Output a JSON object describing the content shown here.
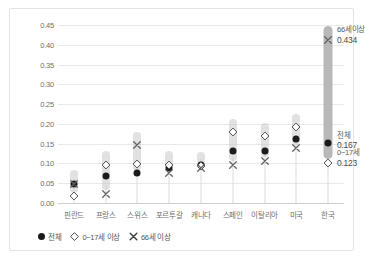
{
  "chart_data": {
    "type": "scatter",
    "title": "",
    "xlabel": "",
    "ylabel": "",
    "ylim": [
      0,
      0.45
    ],
    "grid": true,
    "legend_position": "bottom-left",
    "ytick_labels": [
      "0.45",
      "0.40",
      "0.35",
      "0.30",
      "0.25",
      "0.20",
      "0.15",
      "0.10",
      "0.05",
      "0.00"
    ],
    "ytick_values": [
      0.45,
      0.4,
      0.35,
      0.3,
      0.25,
      0.2,
      0.15,
      0.1,
      0.05,
      0.0
    ],
    "categories": [
      "핀란드",
      "프랑스",
      "스위스",
      "포르투갈",
      "캐나다",
      "스페인",
      "이탈리아",
      "미국",
      "한국"
    ],
    "series": [
      {
        "name": "전체",
        "marker": "filled-circle",
        "values": [
          0.065,
          0.085,
          0.093,
          0.105,
          0.113,
          0.148,
          0.148,
          0.178,
          0.167
        ]
      },
      {
        "name": "0~17세 이상",
        "marker": "diamond",
        "values": [
          0.038,
          0.118,
          0.12,
          0.118,
          0.116,
          0.2,
          0.19,
          0.213,
          0.123
        ]
      },
      {
        "name": "66세 이상",
        "marker": "cross",
        "values": [
          0.07,
          0.045,
          0.168,
          0.098,
          0.11,
          0.118,
          0.128,
          0.16,
          0.434
        ]
      }
    ],
    "annotations": [
      {
        "label": "66세이상",
        "value": "0.434",
        "category": "한국",
        "at": 0.434
      },
      {
        "label": "전체",
        "value": "0.167",
        "category": "한국",
        "at": 0.167
      },
      {
        "label": "0~17세",
        "value": "0.123",
        "category": "한국",
        "at": 0.123
      }
    ]
  },
  "legend": {
    "items": [
      {
        "label": "전체",
        "symbol": "filled-circle-icon"
      },
      {
        "label": "0~17세 이상",
        "symbol": "diamond-icon"
      },
      {
        "label": "66세 이상",
        "symbol": "cross-icon"
      }
    ]
  }
}
